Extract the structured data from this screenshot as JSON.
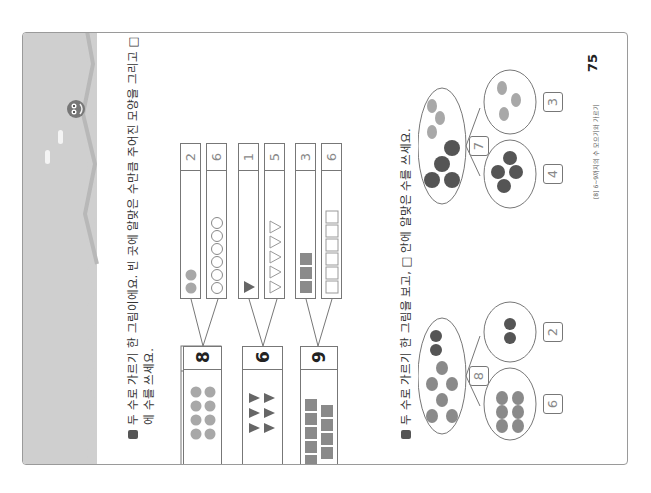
{
  "page": {
    "number": "75",
    "footer_caption": "[8] 6~9까지의 수 모으기와 가르기",
    "colors": {
      "band": "#cfcfcf",
      "band_dark": "#b8b8b8",
      "dot_light": "#a8a8a8",
      "dot_dark": "#5f5f5f",
      "outline": "#777777"
    }
  },
  "problem1": {
    "instruction_line1": "두 수로 가르기 한 그림이에요. 빈 곳에 알맞은 수만큼 주어진 모양을 그리고 □ 안",
    "instruction_line2": "에 수를 쓰세요.",
    "items": [
      {
        "total": "8",
        "shape": "circle",
        "part_a": "2",
        "part_a_drawn": 2,
        "part_b": "6",
        "part_b_drawn": 6,
        "part_b_style": "outline"
      },
      {
        "total": "6",
        "shape": "triangle",
        "part_a": "1",
        "part_a_drawn": 1,
        "part_b": "5",
        "part_b_drawn": 5,
        "part_b_style": "outline"
      },
      {
        "total": "9",
        "shape": "square",
        "part_a": "3",
        "part_a_drawn": 3,
        "part_b": "6",
        "part_b_drawn": 6,
        "part_b_style": "outline"
      }
    ]
  },
  "problem2": {
    "instruction": "두 수로 가르기 한 그림을 보고, □ 안에 알맞은 수를 쓰세요.",
    "items": [
      {
        "total": "8",
        "object": "apple/plum",
        "part_a": "6",
        "part_b": "2"
      },
      {
        "total": "7",
        "object": "ball/fish",
        "part_a": "4",
        "part_b": "3"
      }
    ]
  }
}
